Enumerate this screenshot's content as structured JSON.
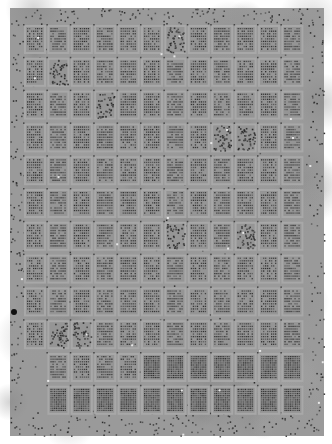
{
  "image": {
    "description": "Grayscale microarray scan: grid of rectangular spot blocks with dot patterns, surrounded by scattered debris border",
    "width": 332,
    "height": 444,
    "frame": {
      "x": 10,
      "y": 8,
      "w": 314,
      "h": 428
    },
    "background_gray": "#9a9a9a",
    "margin_color": "#ffffff"
  },
  "grid": {
    "columns": 12,
    "rows": 12,
    "origin_x": 26,
    "origin_y": 27,
    "pitch_x": 23.4,
    "pitch_y": 32.8,
    "block_w": 18,
    "block_h": 25,
    "dot_rows_per_block": 9,
    "dot_cols_per_block": 8,
    "empty_first_column_rows": [
      10,
      11
    ],
    "dense_uniform_rows": [
      11
    ],
    "random_blocks": [
      [
        0,
        6
      ],
      [
        1,
        1
      ],
      [
        3,
        9
      ],
      [
        2,
        3
      ],
      [
        3,
        8
      ],
      [
        6,
        6
      ],
      [
        6,
        9
      ],
      [
        9,
        1
      ],
      [
        9,
        2
      ]
    ],
    "dot_color": "#3a3a3a",
    "gap_color": "#a8a8a8"
  }
}
